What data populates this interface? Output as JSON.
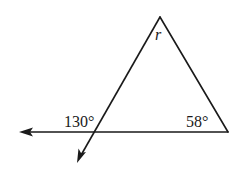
{
  "figure": {
    "labels": {
      "apex_angle": "r",
      "exterior_angle": "130°",
      "right_angle": "58°"
    },
    "angles": {
      "exterior_angle_deg": 130,
      "right_interior_angle_deg": 58,
      "apex_variable": "r"
    },
    "colors": {
      "line": "#1a1a1a",
      "background": "#ffffff"
    }
  }
}
